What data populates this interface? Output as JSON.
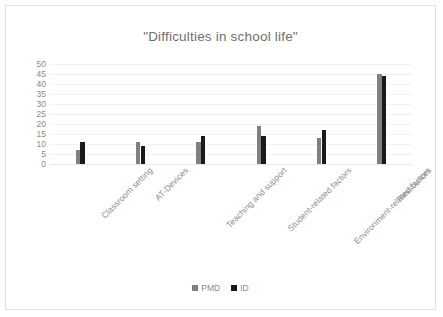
{
  "chart_data": {
    "type": "bar",
    "title": "\"Difficulties in school life\"",
    "xlabel": "",
    "ylabel": "",
    "ylim": [
      0,
      50
    ],
    "ytick_step": 5,
    "yticks": [
      "50",
      "45",
      "40",
      "35",
      "30",
      "25",
      "20",
      "15",
      "10",
      "5",
      "0"
    ],
    "grid": true,
    "legend_position": "bottom",
    "categories": [
      "Classroom setting",
      "AT-Devices",
      "Teaching and support",
      "Student-related factors",
      "Environment-related factors",
      "Ressources"
    ],
    "series": [
      {
        "name": "PMD",
        "color": "#808080",
        "values": [
          7,
          11,
          11,
          19,
          13,
          45
        ]
      },
      {
        "name": "ID",
        "color": "#1a1a1a",
        "values": [
          11,
          9,
          14,
          14,
          17,
          44
        ]
      }
    ]
  },
  "colors": {
    "series_pmd": "#808080",
    "series_id": "#1a1a1a",
    "title_text": "#6f6f6f",
    "axis_text": "#8a8a8a",
    "gridline": "#f2f2f2",
    "frame_border": "#e2e2e2",
    "background": "#ffffff"
  }
}
